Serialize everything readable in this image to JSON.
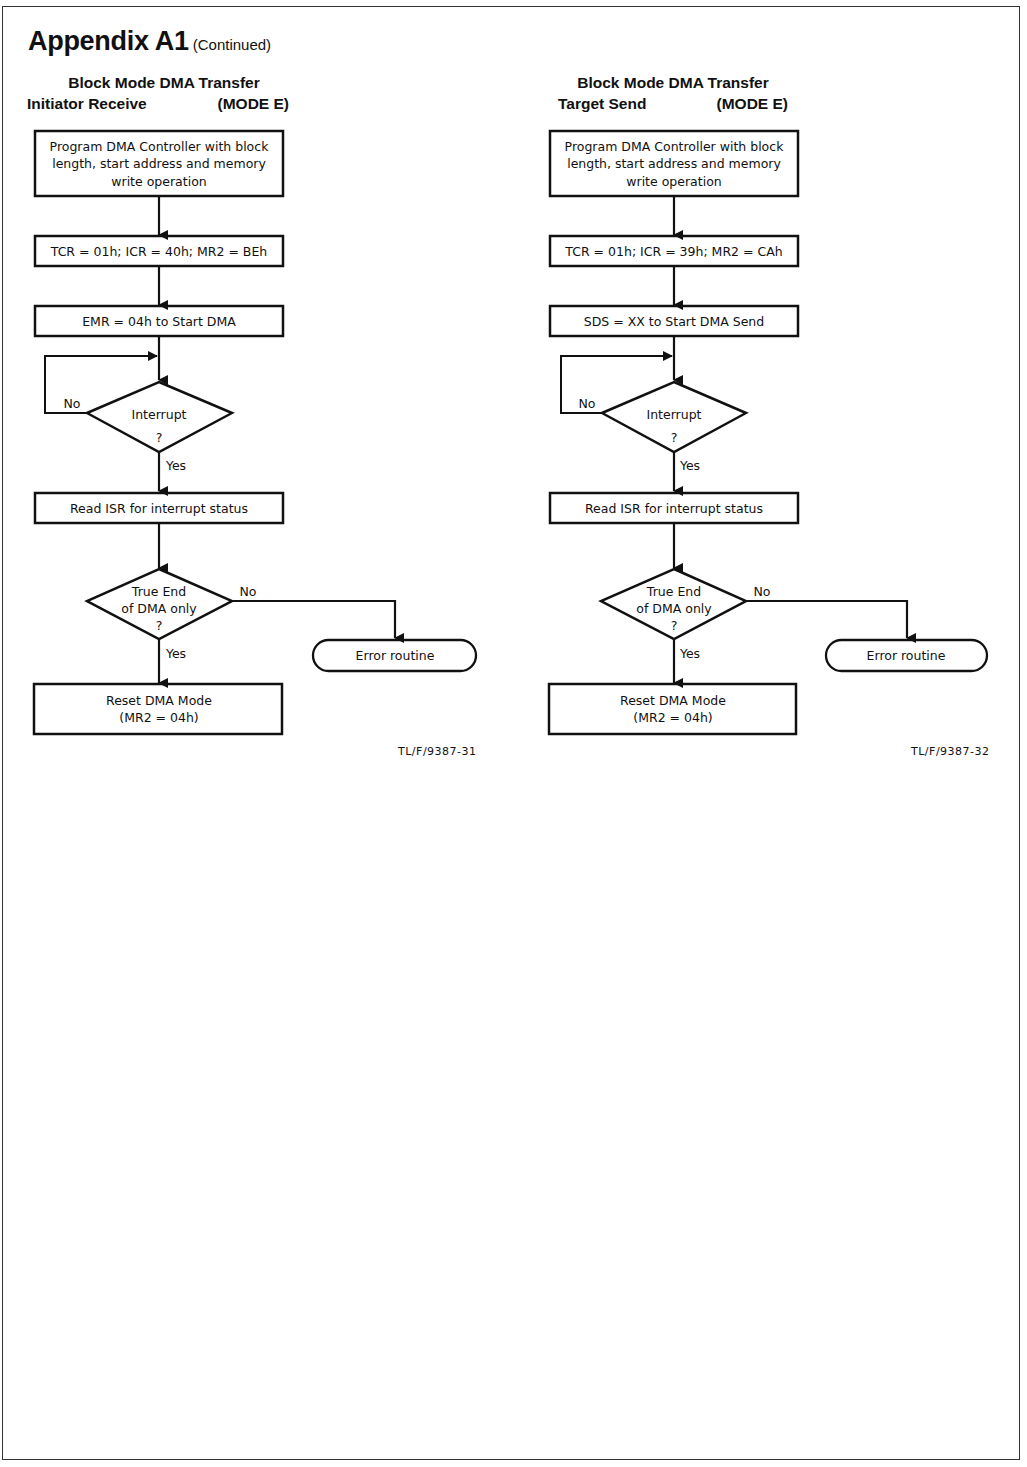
{
  "page": {
    "title": "Appendix A1",
    "title_suffix": "(Continued)"
  },
  "diagrams": [
    {
      "heading_line1": "Block Mode DMA Transfer",
      "heading_line2_left": "Initiator Receive",
      "heading_line2_right": "(MODE E)",
      "figure_id": "TL/F/9387-31",
      "steps": {
        "program": [
          "Program DMA Controller with block",
          "length, start address and memory",
          "write operation"
        ],
        "registers": "TCR = 01h; ICR = 40h; MR2 = BEh",
        "start": "EMR = 04h to Start DMA",
        "interrupt_decision": [
          "Interrupt",
          "?"
        ],
        "read_isr": "Read ISR for interrupt status",
        "end_decision": [
          "True End",
          "of DMA only",
          "?"
        ],
        "error": "Error routine",
        "reset": [
          "Reset DMA Mode",
          "(MR2 = 04h)"
        ]
      },
      "labels": {
        "no1": "No",
        "yes1": "Yes",
        "no2": "No",
        "yes2": "Yes"
      }
    },
    {
      "heading_line1": "Block Mode DMA Transfer",
      "heading_line2_left": "Target Send",
      "heading_line2_right": "(MODE E)",
      "figure_id": "TL/F/9387-32",
      "steps": {
        "program": [
          "Program DMA Controller with block",
          "length, start address and memory",
          "write operation"
        ],
        "registers": "TCR = 01h; ICR = 39h; MR2 = CAh",
        "start": "SDS = XX to Start DMA Send",
        "interrupt_decision": [
          "Interrupt",
          "?"
        ],
        "read_isr": "Read ISR for interrupt status",
        "end_decision": [
          "True End",
          "of DMA only",
          "?"
        ],
        "error": "Error routine",
        "reset": [
          "Reset DMA Mode",
          "(MR2 = 04h)"
        ]
      },
      "labels": {
        "no1": "No",
        "yes1": "Yes",
        "no2": "No",
        "yes2": "Yes"
      }
    }
  ]
}
